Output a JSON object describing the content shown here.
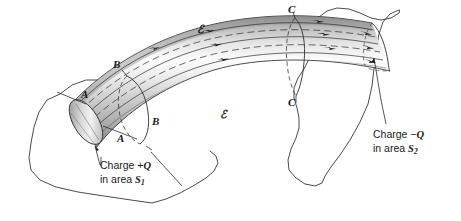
{
  "figure": {
    "kind": "electric-flux-tube-diagram",
    "background_color": "#ffffff",
    "ink_color": "#1a1a1a",
    "tube_shading": {
      "highlight": "#fbfbfb",
      "midtone": "#d8d8d8",
      "shadow": "#9a9a9a",
      "deep_shadow": "#787878"
    },
    "width": 461,
    "height": 221
  },
  "labels": {
    "section_a_upper": "A",
    "section_a_lower": "A",
    "section_b_upper": "B",
    "section_b_lower": "B",
    "section_c_upper": "C",
    "section_c_lower": "C",
    "field_symbol_upper": "ℰ",
    "field_symbol_lower": "ℰ"
  },
  "annotations": {
    "left": {
      "line1_prefix": "Charge +",
      "line1_symbol": "Q",
      "line2_prefix": "in area ",
      "line2_symbol": "S",
      "line2_subscript": "1"
    },
    "right": {
      "line1_prefix": "Charge −",
      "line1_symbol": "Q",
      "line2_prefix": "in area ",
      "line2_symbol": "S",
      "line2_subscript": "2"
    }
  }
}
